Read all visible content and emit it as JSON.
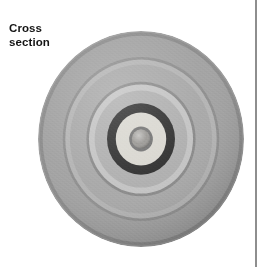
{
  "page": {
    "background_color": "#ffffff",
    "width": 267,
    "height": 267
  },
  "top_caption": {
    "text": "partial cut-off caption line",
    "visible_fragment": ""
  },
  "label": {
    "name": "cross-section-label",
    "line1": "Cross",
    "line2": "section",
    "color": "#141414",
    "bold": true
  },
  "divider": {
    "name": "vertical-rule",
    "color": "#8e8e8e",
    "x": 255,
    "width": 2
  },
  "figure": {
    "name": "cross-section-photograph",
    "center_x": 141,
    "center_y": 139,
    "radius_x": 103,
    "radius_y": 108,
    "bands": [
      {
        "name": "outer-body",
        "outer_r": 1.0,
        "color": "#9b9b9b"
      },
      {
        "name": "outer-edge-shadow",
        "outer_r": 0.985,
        "color": "#8a8a8a"
      },
      {
        "name": "outer-field",
        "outer_r": 0.955,
        "color": "#a0a0a0"
      },
      {
        "name": "ridge-line-1",
        "outer_r": 0.76,
        "color": "#8c8c8c"
      },
      {
        "name": "light-band-1",
        "outer_r": 0.735,
        "color": "#b2b2b2"
      },
      {
        "name": "mid-field",
        "outer_r": 0.69,
        "color": "#a6a6a6"
      },
      {
        "name": "ridge-line-2",
        "outer_r": 0.53,
        "color": "#878787"
      },
      {
        "name": "light-band-2",
        "outer_r": 0.505,
        "color": "#c2c2c2"
      },
      {
        "name": "inner-field",
        "outer_r": 0.45,
        "color": "#adadad"
      },
      {
        "name": "dark-ring",
        "outer_r": 0.33,
        "color": "#2a2a2a"
      },
      {
        "name": "cream-ring",
        "outer_r": 0.245,
        "color": "#d8d6cf"
      },
      {
        "name": "core-halo",
        "outer_r": 0.115,
        "color": "#6e6e6e"
      },
      {
        "name": "core",
        "outer_r": 0.09,
        "color": "#8e8c88"
      }
    ]
  }
}
